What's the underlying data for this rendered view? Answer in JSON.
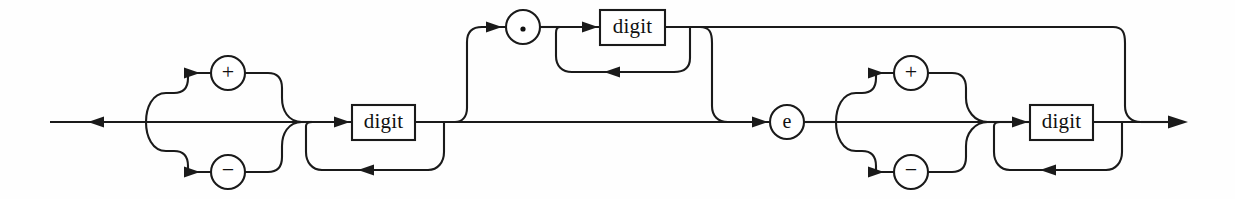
{
  "diagram": {
    "kind": "railroad-syntax-diagram",
    "background_color": "#fefefe",
    "line_color": "#1a1a1a",
    "text_color": "#101010",
    "baseline_y": 122,
    "geometry": {
      "entry_x": 50,
      "exit_x": 1185,
      "upper_track_y": 73,
      "lower_track_y": 172,
      "bypass_y": 27,
      "loop_y": 170,
      "frac_loop_y": 72
    },
    "nodes": [
      {
        "id": "sign-plus",
        "type": "terminal-circle",
        "label": "+",
        "cx": 228,
        "cy": 73,
        "r": 17
      },
      {
        "id": "sign-minus",
        "type": "terminal-circle",
        "label": "−",
        "cx": 228,
        "cy": 172,
        "r": 17
      },
      {
        "id": "int-digit",
        "type": "nonterminal-box",
        "label": "digit",
        "x": 352,
        "y": 105,
        "w": 63,
        "h": 35
      },
      {
        "id": "decimal-point",
        "type": "terminal-circle",
        "label": ".",
        "cx": 523,
        "cy": 27,
        "r": 17
      },
      {
        "id": "frac-digit",
        "type": "nonterminal-box",
        "label": "digit",
        "x": 600,
        "y": 10,
        "w": 65,
        "h": 35
      },
      {
        "id": "exponent-e",
        "type": "terminal-circle",
        "label": "e",
        "cx": 787,
        "cy": 122,
        "r": 17
      },
      {
        "id": "exp-sign-plus",
        "type": "terminal-circle",
        "label": "+",
        "cx": 911,
        "cy": 73,
        "r": 17
      },
      {
        "id": "exp-sign-minus",
        "type": "terminal-circle",
        "label": "−",
        "cx": 911,
        "cy": 172,
        "r": 17
      },
      {
        "id": "exp-digit",
        "type": "nonterminal-box",
        "label": "digit",
        "x": 1030,
        "y": 105,
        "w": 63,
        "h": 35
      }
    ],
    "labels": {
      "digit": "digit",
      "plus": "+",
      "minus": "−",
      "dot": ".",
      "exponent": "e"
    },
    "groups": [
      {
        "id": "sign-choice",
        "name": "optional leading sign",
        "options": [
          "+",
          "−",
          "(none)"
        ]
      },
      {
        "id": "integer-part",
        "name": "one or more digits",
        "repeats": true
      },
      {
        "id": "fraction-part",
        "name": "optional fraction",
        "optional": true
      },
      {
        "id": "exponent-part",
        "name": "optional exponent",
        "optional": true
      },
      {
        "id": "exponent-sign-choice",
        "name": "optional exponent sign",
        "options": [
          "+",
          "−",
          "(none)"
        ]
      },
      {
        "id": "exponent-digits",
        "name": "one or more digits",
        "repeats": true
      }
    ]
  }
}
